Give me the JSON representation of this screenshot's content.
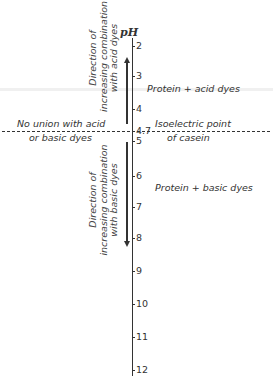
{
  "axis": {
    "label": "pH",
    "ticks": [
      {
        "label": "2",
        "y": 41
      },
      {
        "label": "3",
        "y": 71
      },
      {
        "label": "4",
        "y": 104
      },
      {
        "label": "4.7",
        "y": 126
      },
      {
        "label": "5",
        "y": 136
      },
      {
        "label": "6",
        "y": 171
      },
      {
        "label": "7",
        "y": 202
      },
      {
        "label": "8",
        "y": 233
      },
      {
        "label": "9",
        "y": 266
      },
      {
        "label": "10",
        "y": 299
      },
      {
        "label": "11",
        "y": 332
      },
      {
        "label": "12",
        "y": 365
      }
    ]
  },
  "upper_arrow": {
    "line1": "Direction of",
    "line2": "increasing combination",
    "line3": "with acid dyes"
  },
  "lower_arrow": {
    "line1": "Direction of",
    "line2": "increasing combination",
    "line3": "with basic dyes"
  },
  "regions": {
    "acid": "Protein + acid dyes",
    "basic": "Protein + basic dyes"
  },
  "isoelectric": {
    "left_line1": "No union with acid",
    "left_line2": "or basic dyes",
    "right_line1": "Isoelectric point",
    "right_line2": "of casein"
  }
}
